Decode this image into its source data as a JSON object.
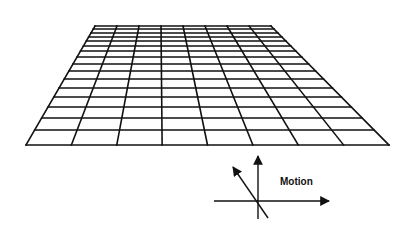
{
  "figure": {
    "grid": {
      "top_left": [
        95,
        26
      ],
      "top_right": [
        271,
        26
      ],
      "bottom_left": [
        26,
        145
      ],
      "bottom_right": [
        389,
        145
      ],
      "columns": 8,
      "row_lines_y": [
        26,
        29,
        33,
        37,
        41,
        46,
        51,
        57,
        64,
        71,
        79,
        88,
        97,
        107,
        118,
        130,
        145
      ],
      "line_color": "#111111"
    },
    "motion_diagram": {
      "label": "Motion",
      "label_position": [
        280,
        185
      ],
      "horizontal_arrow": {
        "from": [
          214,
          201
        ],
        "to": [
          329,
          201
        ]
      },
      "vertical_arrow": {
        "from": [
          258,
          219
        ],
        "to": [
          258,
          156
        ]
      },
      "diagonal_arrow": {
        "from": [
          268,
          218
        ],
        "to": [
          233,
          167
        ]
      }
    }
  }
}
